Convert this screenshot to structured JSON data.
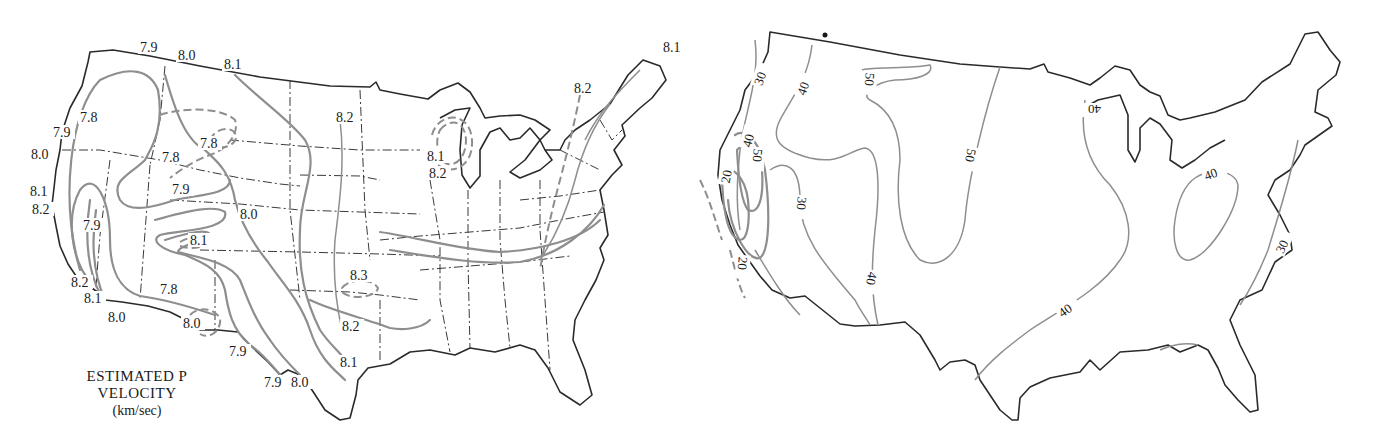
{
  "left_map": {
    "title_line1": "ESTIMATED P",
    "title_line2": "VELOCITY",
    "units": "(km/sec)",
    "contour_labels": [
      {
        "text": "7.9",
        "x": 140,
        "y": 52
      },
      {
        "text": "8.0",
        "x": 178,
        "y": 60
      },
      {
        "text": "8.1",
        "x": 224,
        "y": 69
      },
      {
        "text": "7.8",
        "x": 80,
        "y": 122
      },
      {
        "text": "7.9",
        "x": 53,
        "y": 137
      },
      {
        "text": "8.0",
        "x": 31,
        "y": 159
      },
      {
        "text": "7.8",
        "x": 200,
        "y": 148
      },
      {
        "text": "7.8",
        "x": 162,
        "y": 162
      },
      {
        "text": "7.9",
        "x": 172,
        "y": 194
      },
      {
        "text": "8.0",
        "x": 240,
        "y": 219
      },
      {
        "text": "8.1",
        "x": 30,
        "y": 196
      },
      {
        "text": "8.2",
        "x": 32,
        "y": 214
      },
      {
        "text": "7.9",
        "x": 83,
        "y": 230
      },
      {
        "text": "8.1",
        "x": 190,
        "y": 245
      },
      {
        "text": "8.2",
        "x": 71,
        "y": 287
      },
      {
        "text": "8.1",
        "x": 84,
        "y": 303
      },
      {
        "text": "7.8",
        "x": 160,
        "y": 294
      },
      {
        "text": "8.0",
        "x": 108,
        "y": 322
      },
      {
        "text": "8.0",
        "x": 183,
        "y": 328
      },
      {
        "text": "7.9",
        "x": 229,
        "y": 356
      },
      {
        "text": "7.9",
        "x": 264,
        "y": 387
      },
      {
        "text": "8.0",
        "x": 291,
        "y": 387
      },
      {
        "text": "8.2",
        "x": 336,
        "y": 122
      },
      {
        "text": "8.3",
        "x": 350,
        "y": 280
      },
      {
        "text": "8.2",
        "x": 342,
        "y": 331
      },
      {
        "text": "8.1",
        "x": 340,
        "y": 367
      },
      {
        "text": "8.1",
        "x": 427,
        "y": 161
      },
      {
        "text": "8.2",
        "x": 429,
        "y": 178
      },
      {
        "text": "8.2",
        "x": 574,
        "y": 93
      },
      {
        "text": "8.1",
        "x": 663,
        "y": 52
      }
    ]
  },
  "right_map": {
    "contour_labels": [
      {
        "text": "30",
        "x": 752,
        "y": 82,
        "rot": -70
      },
      {
        "text": "40",
        "x": 795,
        "y": 92,
        "rot": -70
      },
      {
        "text": "50",
        "x": 862,
        "y": 86,
        "rot": 95
      },
      {
        "text": "40",
        "x": 740,
        "y": 144,
        "rot": -75
      },
      {
        "text": "50",
        "x": 750,
        "y": 162,
        "rot": 95
      },
      {
        "text": "20",
        "x": 718,
        "y": 180,
        "rot": -80
      },
      {
        "text": "30",
        "x": 794,
        "y": 210,
        "rot": 95
      },
      {
        "text": "50",
        "x": 963,
        "y": 162,
        "rot": 100
      },
      {
        "text": "40",
        "x": 1085,
        "y": 115,
        "rot": 180
      },
      {
        "text": "40",
        "x": 1204,
        "y": 178,
        "rot": -20
      },
      {
        "text": "20",
        "x": 735,
        "y": 270,
        "rot": 95
      },
      {
        "text": "40",
        "x": 864,
        "y": 285,
        "rot": 100
      },
      {
        "text": "40",
        "x": 1058,
        "y": 314,
        "rot": -35
      },
      {
        "text": "30",
        "x": 1274,
        "y": 250,
        "rot": -65
      }
    ]
  }
}
